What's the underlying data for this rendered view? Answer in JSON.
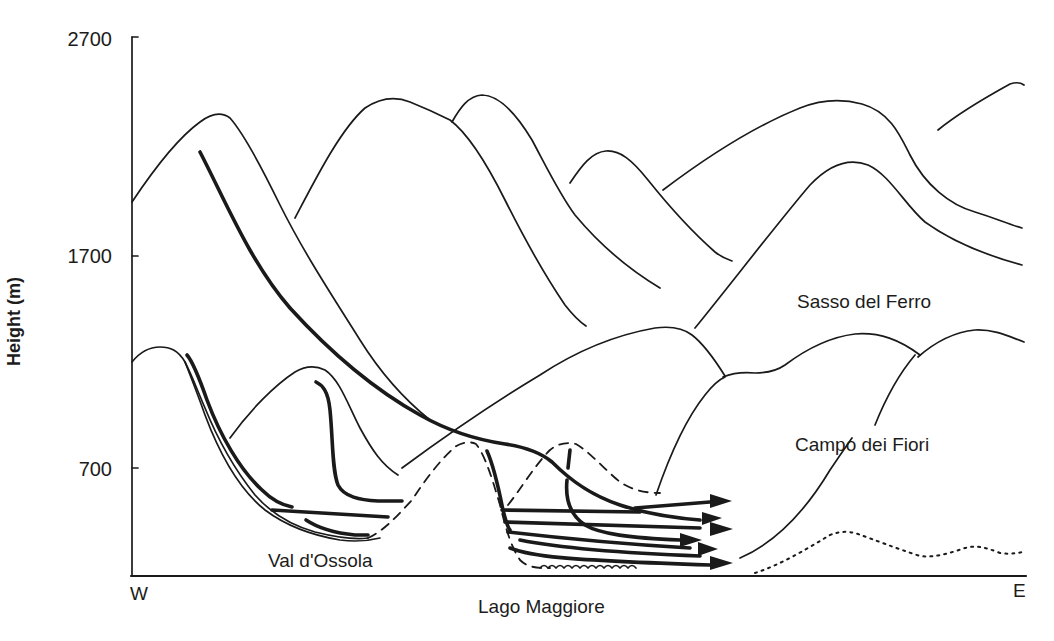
{
  "figure": {
    "type": "cross-section diagram"
  },
  "axes": {
    "y_label": "Height (m)",
    "y_ticks": [
      "2700",
      "1700",
      "700"
    ],
    "y_tick_values": [
      2700,
      1700,
      700
    ],
    "x_left_label": "W",
    "x_right_label": "E",
    "x_center_label": "Lago Maggiore"
  },
  "labels": {
    "sasso_del_ferro": "Sasso del Ferro",
    "campo_dei_fiori": "Campo dei Fiori",
    "val_dossola": "Val d'Ossola"
  },
  "legend_semantics": {
    "thin_solid": "mountain ridge profiles",
    "thick_solid": "airflow streamlines",
    "dashed": "valley / basin outline",
    "dotted": "distant low terrain",
    "wavy": "lake surface"
  },
  "flow_arrows_count": 5
}
